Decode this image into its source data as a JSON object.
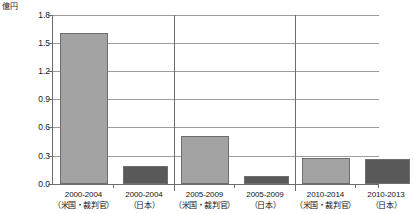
{
  "chart_data": {
    "type": "bar",
    "title": "",
    "unit_label": "億円",
    "xlabel": "",
    "ylabel": "",
    "ylim": [
      0.0,
      1.8
    ],
    "ytick_step": 0.3,
    "grid": true,
    "legend_position": "none",
    "yticks": [
      "0.0",
      "0.3",
      "0.6",
      "0.9",
      "1.2",
      "1.5",
      "1.8"
    ],
    "ytick_values": [
      0.0,
      0.3,
      0.6,
      0.9,
      1.2,
      1.5,
      1.8
    ],
    "categories": [
      "2000-2004（米国・裁判官）",
      "2000-2004（日本）",
      "2005-2009（米国・裁判官）",
      "2005-2009（日本）",
      "2010-2014（米国・裁判官）",
      "2010-2013（日本）"
    ],
    "category_lines": [
      {
        "line1": "2000-2004",
        "line2": "（米国・裁判官）"
      },
      {
        "line1": "2000-2004",
        "line2": "（日本）"
      },
      {
        "line1": "2005-2009",
        "line2": "（米国・裁判官）"
      },
      {
        "line1": "2005-2009",
        "line2": "（日本）"
      },
      {
        "line1": "2010-2014",
        "line2": "（米国・裁判官）"
      },
      {
        "line1": "2010-2013",
        "line2": "（日本）"
      }
    ],
    "values": [
      1.61,
      0.19,
      0.51,
      0.08,
      0.28,
      0.27
    ],
    "series": [
      {
        "name": "米国・裁判官",
        "color": "#a3a3a3",
        "values": [
          1.61,
          null,
          0.51,
          null,
          0.28,
          null
        ]
      },
      {
        "name": "日本",
        "color": "#595959",
        "values": [
          null,
          0.19,
          null,
          0.08,
          null,
          0.27
        ]
      }
    ],
    "bar_colors": [
      "#a3a3a3",
      "#595959",
      "#a3a3a3",
      "#595959",
      "#a3a3a3",
      "#595959"
    ],
    "group_separators": [
      2,
      4
    ],
    "colors": {
      "us_judge": "#a3a3a3",
      "japan": "#595959",
      "axis": "#6b6b6b",
      "grid": "#9c9c9c",
      "background": "#ffffff",
      "text": "#111111"
    }
  }
}
